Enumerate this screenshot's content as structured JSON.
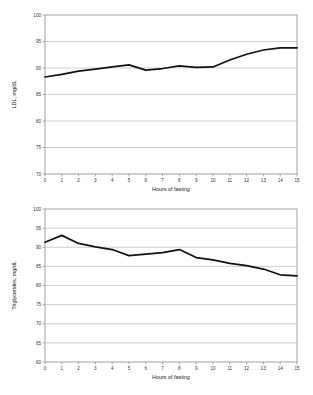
{
  "chart_data": [
    {
      "id": "ldl",
      "type": "line",
      "title": "",
      "xlabel": "Hours of fasting",
      "ylabel": "LDL, mg/dL",
      "xlim": [
        0,
        15
      ],
      "ylim": [
        70,
        100
      ],
      "yticks": [
        70,
        75,
        80,
        85,
        90,
        95,
        100
      ],
      "ytick_labels": [
        "70",
        "75",
        "80",
        "85",
        "90",
        "95",
        "100"
      ],
      "xticks": [
        0,
        1,
        2,
        3,
        4,
        5,
        6,
        7,
        8,
        9,
        10,
        11,
        12,
        13,
        14,
        15
      ],
      "xtick_labels": [
        "0",
        "1",
        "2",
        "3",
        "4",
        "5",
        "6",
        "7",
        "8",
        "9",
        "10",
        "11",
        "12",
        "13",
        "14",
        "15"
      ],
      "grid": "horizontal",
      "legend": "none",
      "line_color": "#111111",
      "x": [
        0,
        1,
        2,
        3,
        4,
        5,
        6,
        7,
        8,
        9,
        10,
        11,
        12,
        13,
        14,
        15
      ],
      "values": [
        88.3,
        88.8,
        89.4,
        89.8,
        90.2,
        90.6,
        89.6,
        89.9,
        90.4,
        90.1,
        90.2,
        91.5,
        92.6,
        93.4,
        93.8,
        93.8
      ]
    },
    {
      "id": "tg",
      "type": "line",
      "title": "",
      "xlabel": "Hours of fasting",
      "ylabel": "Triglycerides, mg/dL",
      "xlim": [
        0,
        15
      ],
      "ylim": [
        60,
        100
      ],
      "yticks": [
        60,
        65,
        70,
        75,
        80,
        85,
        90,
        95,
        100
      ],
      "ytick_labels": [
        "60",
        "65",
        "70",
        "75",
        "80",
        "85",
        "90",
        "95",
        "100"
      ],
      "xticks": [
        0,
        1,
        2,
        3,
        4,
        5,
        6,
        7,
        8,
        9,
        10,
        11,
        12,
        13,
        14,
        15
      ],
      "xtick_labels": [
        "0",
        "1",
        "2",
        "3",
        "4",
        "5",
        "6",
        "7",
        "8",
        "9",
        "10",
        "11",
        "12",
        "13",
        "14",
        "15"
      ],
      "grid": "horizontal",
      "legend": "none",
      "line_color": "#111111",
      "x": [
        0,
        1,
        2,
        3,
        4,
        5,
        6,
        7,
        8,
        9,
        10,
        11,
        12,
        13,
        14,
        15
      ],
      "values": [
        91.3,
        93.1,
        91.0,
        90.1,
        89.4,
        87.8,
        88.2,
        88.6,
        89.4,
        87.3,
        86.7,
        85.8,
        85.2,
        84.3,
        82.8,
        82.5
      ]
    }
  ]
}
